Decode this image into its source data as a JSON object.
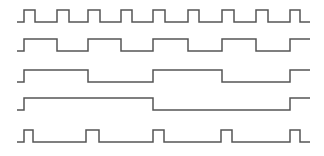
{
  "diagram": {
    "type": "timing-diagram",
    "stroke_color": "#555555",
    "background": "#ffffff",
    "x_start": 17,
    "x_end": 310,
    "signals": [
      {
        "name": "waveform-1",
        "high_y": 10,
        "low_y": 22,
        "initial": "low",
        "edges": [
          24,
          35,
          57,
          69,
          88,
          100,
          121,
          132,
          153,
          165,
          188,
          199,
          222,
          234,
          256,
          268,
          290,
          300
        ]
      },
      {
        "name": "waveform-2",
        "high_y": 39,
        "low_y": 51,
        "initial": "low",
        "edges": [
          24,
          57,
          88,
          121,
          153,
          188,
          222,
          256,
          290
        ]
      },
      {
        "name": "waveform-3",
        "high_y": 70,
        "low_y": 82,
        "initial": "low",
        "edges": [
          24,
          88,
          153,
          222,
          290
        ]
      },
      {
        "name": "waveform-4",
        "high_y": 98,
        "low_y": 110,
        "initial": "low",
        "edges": [
          24,
          153,
          290
        ]
      },
      {
        "name": "waveform-5",
        "high_y": 130,
        "low_y": 142,
        "initial": "low",
        "edges": [
          24,
          33,
          86,
          99,
          153,
          164,
          221,
          232,
          290,
          300
        ]
      }
    ]
  }
}
